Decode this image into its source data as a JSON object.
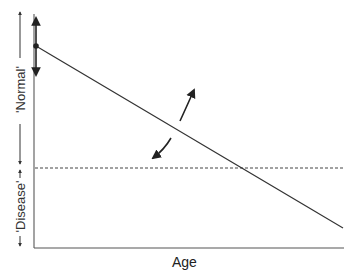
{
  "diagram": {
    "x_axis_label": "Age",
    "y_band_labels": [
      {
        "label": "'Normal'",
        "position": "upper"
      },
      {
        "label": "'Disease'",
        "position": "lower"
      }
    ],
    "elements": {
      "trajectory_line": "declining linear trajectory from starting value at young age",
      "threshold_line": "dashed horizontal threshold between normal and disease",
      "start_range_arrow": "double-headed vertical arrow indicating variation of starting level",
      "rotation_arrows": "curved arrows indicating variation of slope"
    },
    "colors": {
      "line": "#333333",
      "axis": "#555555",
      "background": "#ffffff"
    }
  }
}
